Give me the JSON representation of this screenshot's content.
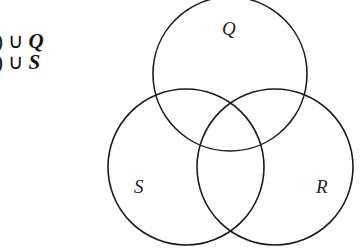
{
  "expressions": [
    {
      "prefix": ") ∪ ",
      "var": "Q"
    },
    {
      "prefix": ") ∪ ",
      "var": "S"
    }
  ],
  "venn": {
    "sets": [
      {
        "name": "Q",
        "label": "Q",
        "cx": 230,
        "cy": 74,
        "r": 77,
        "label_x": 222,
        "label_y": 35
      },
      {
        "name": "S",
        "label": "S",
        "cx": 186,
        "cy": 167,
        "r": 78,
        "label_x": 134,
        "label_y": 193
      },
      {
        "name": "R",
        "label": "R",
        "cx": 275,
        "cy": 167,
        "r": 78,
        "label_x": 316,
        "label_y": 193
      }
    ],
    "stroke_color": "#1a1a1a"
  }
}
